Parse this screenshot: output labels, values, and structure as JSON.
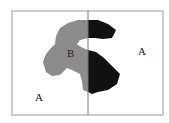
{
  "diagram": {
    "regions": [
      {
        "label": "A",
        "position": "bottom-left"
      },
      {
        "label": "B",
        "position": "center-gray-shape"
      },
      {
        "label": "A",
        "position": "right"
      }
    ],
    "labels": {
      "a_left": "A",
      "b_center": "B",
      "a_right": "A"
    },
    "colors": {
      "frame": "#999999",
      "gray_shape": "#8c8c8c",
      "black_shape": "#111111",
      "background": "#ffffff"
    }
  }
}
